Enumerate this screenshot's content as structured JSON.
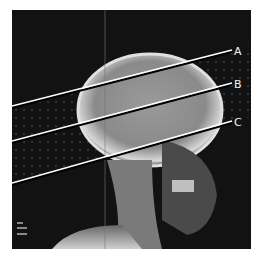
{
  "figure": {
    "background": "#121212",
    "lines": [
      {
        "label": "A",
        "x1": 0,
        "y1": 97,
        "x2": 220,
        "y2": 41
      },
      {
        "label": "B",
        "x1": 0,
        "y1": 132,
        "x2": 220,
        "y2": 74
      },
      {
        "label": "C",
        "x1": 0,
        "y1": 174,
        "x2": 220,
        "y2": 112
      }
    ],
    "corner_marker": "film marker (bottom-left)"
  }
}
